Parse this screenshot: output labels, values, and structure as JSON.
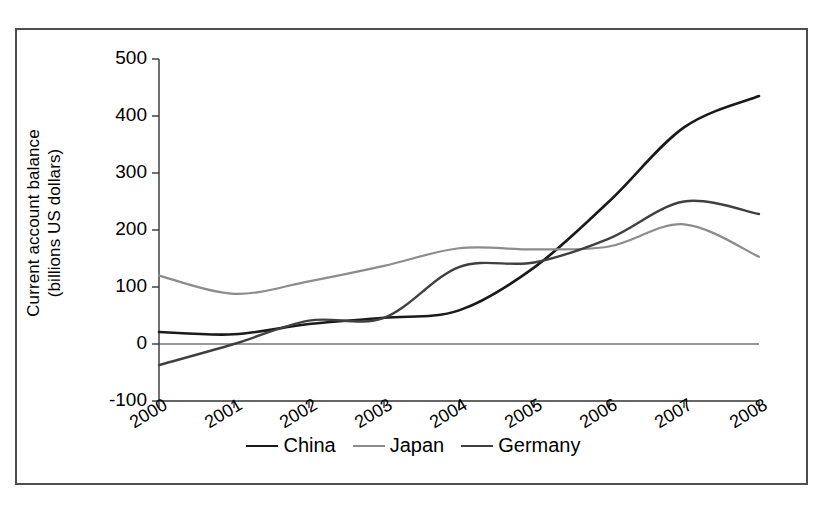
{
  "chart_data": {
    "type": "line",
    "title": "",
    "xlabel": "",
    "ylabel": "Current account balance (billions US dollars)",
    "ylabel_line1": "Current account balance",
    "ylabel_line2": "(billions US dollars)",
    "categories": [
      "2000",
      "2001",
      "2002",
      "2003",
      "2004",
      "2005",
      "2006",
      "2007",
      "2008"
    ],
    "x": [
      2000,
      2001,
      2002,
      2003,
      2004,
      2005,
      2006,
      2007,
      2008
    ],
    "ylim": [
      -100,
      500
    ],
    "yticks": [
      -100,
      0,
      100,
      200,
      300,
      400,
      500
    ],
    "ytick_labels": [
      "-100",
      "0",
      "100",
      "200",
      "300",
      "400",
      "500"
    ],
    "grid": false,
    "legend_position": "bottom",
    "series": [
      {
        "name": "China",
        "color": "#1a1a1a",
        "width": 2.6,
        "values": [
          21,
          17,
          35,
          46,
          59,
          134,
          250,
          380,
          435
        ]
      },
      {
        "name": "Japan",
        "color": "#8c8c8c",
        "width": 2.2,
        "values": [
          120,
          88,
          110,
          137,
          168,
          166,
          171,
          210,
          153
        ]
      },
      {
        "name": "Germany",
        "color": "#404040",
        "width": 2.4,
        "values": [
          -37,
          0,
          41,
          46,
          135,
          143,
          185,
          250,
          228
        ]
      }
    ]
  },
  "legend": {
    "entries": [
      {
        "label": "China"
      },
      {
        "label": "Japan"
      },
      {
        "label": "Germany"
      }
    ]
  }
}
